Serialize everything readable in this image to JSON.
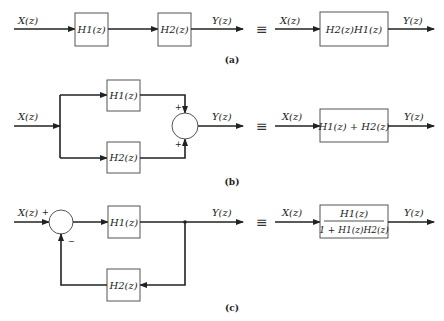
{
  "figure": {
    "panels": [
      {
        "id": "a",
        "caption": "(a)",
        "left": {
          "input": "X(z)",
          "blocks": [
            "H1(z)",
            "H2(z)"
          ],
          "output": "Y(z)",
          "topology": "cascade"
        },
        "equivalence_symbol": "≡",
        "right": {
          "input": "X(z)",
          "block": "H2(z)H1(z)",
          "output": "Y(z)"
        }
      },
      {
        "id": "b",
        "caption": "(b)",
        "left": {
          "input": "X(z)",
          "blocks": [
            "H1(z)",
            "H2(z)"
          ],
          "summer_signs": [
            "+",
            "+"
          ],
          "output": "Y(z)",
          "topology": "parallel"
        },
        "equivalence_symbol": "≡",
        "right": {
          "input": "X(z)",
          "block": "H1(z) + H2(z)",
          "output": "Y(z)"
        }
      },
      {
        "id": "c",
        "caption": "(c)",
        "left": {
          "input": "X(z)",
          "forward_block": "H1(z)",
          "feedback_block": "H2(z)",
          "summer_signs": [
            "+",
            "−"
          ],
          "output": "Y(z)",
          "topology": "negative feedback"
        },
        "equivalence_symbol": "≡",
        "right": {
          "input": "X(z)",
          "block_numerator": "H1(z)",
          "block_denominator": "1 + H1(z)H2(z)",
          "output": "Y(z)"
        }
      }
    ]
  },
  "colors": {
    "stroke": "#222222",
    "box_stroke": "#555555",
    "background": "#ffffff"
  }
}
